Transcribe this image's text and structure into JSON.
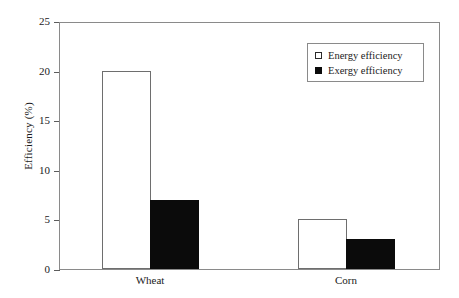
{
  "chart_data": {
    "type": "bar",
    "title": "",
    "subtitle": "",
    "xlabel": "",
    "ylabel": "Efficiency (%)",
    "categories": [
      "Wheat",
      "Corn"
    ],
    "series": [
      {
        "name": "Energy efficiency",
        "marker": "open-square",
        "color": "#ffffff",
        "edge_color": "#6e6e6e",
        "values": [
          20,
          5
        ]
      },
      {
        "name": "Exergy efficiency",
        "marker": "filled-square",
        "color": "#0b0b0b",
        "edge_color": "#0b0b0b",
        "values": [
          7,
          3
        ]
      }
    ],
    "ylim": [
      0,
      25
    ],
    "yticks": [
      0,
      5,
      10,
      15,
      20,
      25
    ],
    "ytick_labels": [
      "0",
      "5",
      "10",
      "15",
      "20",
      "25"
    ],
    "grid": false,
    "legend_position": "top-right"
  },
  "axes": {
    "y_title": "Efficiency (%)",
    "y_tick_labels": [
      "25",
      "20",
      "15",
      "10",
      "5",
      "0"
    ],
    "x_tick_labels": [
      "Wheat",
      "Corn"
    ]
  },
  "legend": {
    "entries": [
      {
        "label": "Energy efficiency",
        "swatch": "open-square"
      },
      {
        "label": "Exergy efficiency",
        "swatch": "filled-square"
      }
    ]
  },
  "bars": [
    {
      "name": "wheat-energy",
      "group": "Wheat",
      "series": "Energy efficiency",
      "value": 20,
      "style": "open"
    },
    {
      "name": "wheat-exergy",
      "group": "Wheat",
      "series": "Exergy efficiency",
      "value": 7,
      "style": "filled"
    },
    {
      "name": "corn-energy",
      "group": "Corn",
      "series": "Energy efficiency",
      "value": 5,
      "style": "open"
    },
    {
      "name": "corn-exergy",
      "group": "Corn",
      "series": "Exergy efficiency",
      "value": 3,
      "style": "filled"
    }
  ]
}
